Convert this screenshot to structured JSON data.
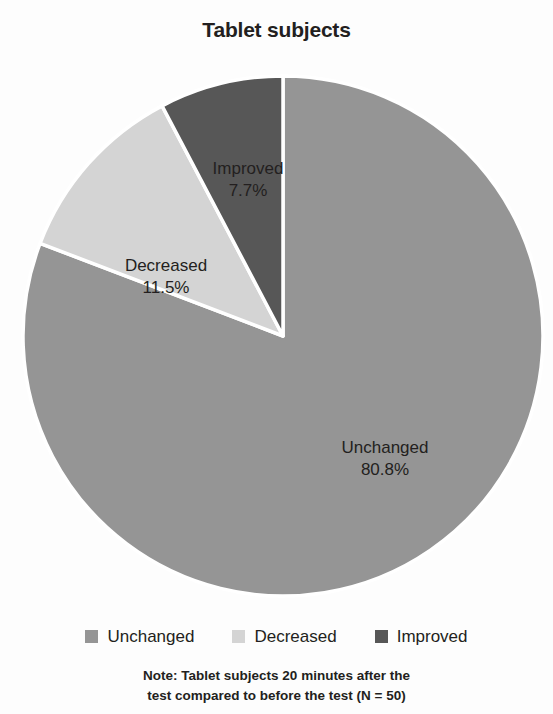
{
  "chart_data": {
    "type": "pie",
    "title": "Tablet subjects",
    "categories": [
      "Unchanged",
      "Decreased",
      "Improved"
    ],
    "values": [
      80.8,
      11.5,
      7.7
    ],
    "value_labels": [
      "80.8%",
      "11.5%",
      "7.7%"
    ],
    "colors": [
      "#959595",
      "#d4d4d4",
      "#575757"
    ],
    "start_angle_deg": 0,
    "direction": "clockwise",
    "slice_label_position": "inside",
    "legend_position": "bottom",
    "grid": false,
    "xlabel": "",
    "ylabel": "",
    "note": "Note: Tablet subjects 20 minutes after the test compared to before the test (N = 50)",
    "slices": [
      {
        "name": "Unchanged",
        "value": 80.8,
        "label": "Unchanged",
        "value_label": "80.8%",
        "color": "#959595"
      },
      {
        "name": "Decreased",
        "value": 11.5,
        "label": "Decreased",
        "value_label": "11.5%",
        "color": "#d4d4d4"
      },
      {
        "name": "Improved",
        "value": 7.7,
        "label": "Improved",
        "value_label": "7.7%",
        "color": "#575757"
      }
    ]
  },
  "legend": {
    "items": [
      {
        "label": "Unchanged",
        "color": "#959595"
      },
      {
        "label": "Decreased",
        "color": "#d4d4d4"
      },
      {
        "label": "Improved",
        "color": "#575757"
      }
    ]
  },
  "note": {
    "line1": "Note: Tablet subjects 20 minutes after the",
    "line2": "test compared to before the test (N = 50)"
  },
  "theme": {
    "background": "#fdfdfd",
    "text": "#231f20",
    "slice_border": "#ffffff"
  }
}
